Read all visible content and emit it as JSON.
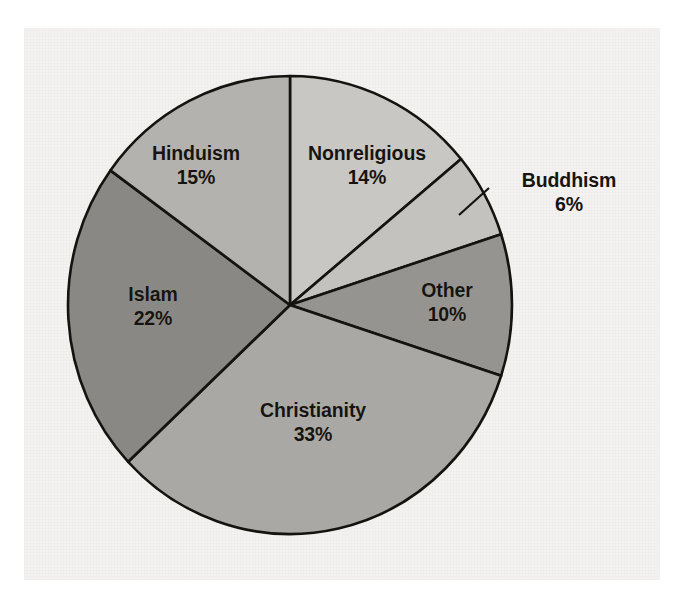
{
  "figure": {
    "kind": "pie-chart",
    "background_color": "#ffffff",
    "paper_color": "#f3f2f0",
    "outline_color": "#15130f",
    "label_text_color": "#16140f"
  },
  "chart_data": {
    "type": "pie",
    "title": "",
    "xlabel": "",
    "ylabel": "",
    "legend_position": "none",
    "grid": false,
    "units": "percent",
    "start_angle_deg": 0,
    "direction": "clockwise",
    "total": 100,
    "categories": [
      "Nonreligious",
      "Buddhism",
      "Other",
      "Christianity",
      "Islam",
      "Hinduism"
    ],
    "values": [
      14,
      6,
      10,
      33,
      22,
      15
    ],
    "labels": [
      "14%",
      "6%",
      "10%",
      "33%",
      "22%",
      "15%"
    ],
    "colors": [
      "#c9c7c4",
      "#c4c2bf",
      "#969490",
      "#aaa8a4",
      "#8a8884",
      "#b4b2ae"
    ],
    "slices": [
      {
        "name": "Nonreligious",
        "value": 14,
        "label": "14%",
        "color": "#c9c7c4",
        "label_placement": "inside",
        "has_leader_line": false
      },
      {
        "name": "Buddhism",
        "value": 6,
        "label": "6%",
        "color": "#c4c2bf",
        "label_placement": "outside",
        "has_leader_line": true
      },
      {
        "name": "Other",
        "value": 10,
        "label": "10%",
        "color": "#969490",
        "label_placement": "inside",
        "has_leader_line": false
      },
      {
        "name": "Christianity",
        "value": 33,
        "label": "33%",
        "color": "#aaa8a4",
        "label_placement": "inside",
        "has_leader_line": false
      },
      {
        "name": "Islam",
        "value": 22,
        "label": "22%",
        "color": "#8a8884",
        "label_placement": "inside",
        "has_leader_line": false
      },
      {
        "name": "Hinduism",
        "value": 15,
        "label": "15%",
        "color": "#b4b2ae",
        "label_placement": "inside",
        "has_leader_line": false
      }
    ]
  }
}
